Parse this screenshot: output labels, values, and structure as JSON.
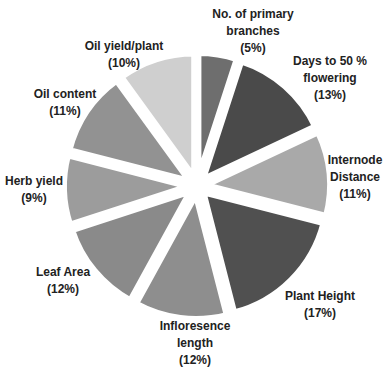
{
  "chart_data": {
    "type": "pie",
    "title": "",
    "exploded": true,
    "slices": [
      {
        "label": "No. of primary branches",
        "line1": "No. of primary",
        "line2": "branches",
        "pct_label": "(5%)",
        "value": 5,
        "color": "#6e6e6e"
      },
      {
        "label": "Days to 50 % flowering",
        "line1": "Days to 50 %",
        "line2": "flowering",
        "pct_label": "(13%)",
        "value": 13,
        "color": "#4a4a4a"
      },
      {
        "label": "Internode Distance",
        "line1": "Internode",
        "line2": "Distance",
        "pct_label": "(11%)",
        "value": 11,
        "color": "#a9a9a9"
      },
      {
        "label": "Plant Height",
        "line1": "Plant Height",
        "line2": "",
        "pct_label": "(17%)",
        "value": 17,
        "color": "#505050"
      },
      {
        "label": "Infloresence length",
        "line1": "Infloresence",
        "line2": "length",
        "pct_label": "(12%)",
        "value": 12,
        "color": "#8e8e8e"
      },
      {
        "label": "Leaf Area",
        "line1": "Leaf Area",
        "line2": "",
        "pct_label": "(12%)",
        "value": 12,
        "color": "#8a8a8a"
      },
      {
        "label": "Herb yield",
        "line1": "Herb yield",
        "line2": "",
        "pct_label": "(9%)",
        "value": 9,
        "color": "#9c9c9c"
      },
      {
        "label": "Oil content",
        "line1": "Oil content",
        "line2": "",
        "pct_label": "(11%)",
        "value": 11,
        "color": "#929292"
      },
      {
        "label": "Oil yield/plant",
        "line1": "Oil yield/plant",
        "line2": "",
        "pct_label": "(10%)",
        "value": 10,
        "color": "#cfcfcf"
      }
    ],
    "legend": "none (labels outside slices)"
  }
}
